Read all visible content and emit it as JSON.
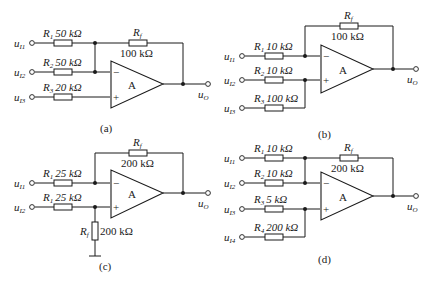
{
  "figure": {
    "circuits": [
      {
        "id": "a",
        "caption": "(a)",
        "amp_label": "A",
        "inputs": [
          {
            "node": "u",
            "sub": "I1",
            "res_name": "R",
            "res_sub": "1",
            "value": "50 kΩ",
            "to": "inverting"
          },
          {
            "node": "u",
            "sub": "I2",
            "res_name": "R",
            "res_sub": "2",
            "value": "50 kΩ",
            "to": "inverting"
          },
          {
            "node": "u",
            "sub": "I3",
            "res_name": "R",
            "res_sub": "3",
            "value": "20 kΩ",
            "to": "non-inverting"
          }
        ],
        "feedback": {
          "res_name": "R",
          "res_sub": "f",
          "value": "100 kΩ"
        },
        "output": {
          "node": "u",
          "sub": "O"
        },
        "minus": "−",
        "plus": "+"
      },
      {
        "id": "b",
        "caption": "(b)",
        "amp_label": "A",
        "inputs": [
          {
            "node": "u",
            "sub": "I1",
            "res_name": "R",
            "res_sub": "1",
            "value": "10 kΩ",
            "to": "inverting"
          },
          {
            "node": "u",
            "sub": "I2",
            "res_name": "R",
            "res_sub": "2",
            "value": "10 kΩ",
            "to": "non-inverting"
          },
          {
            "node": "u",
            "sub": "I3",
            "res_name": "R",
            "res_sub": "3",
            "value": "100 kΩ",
            "to": "non-inverting"
          }
        ],
        "feedback": {
          "res_name": "R",
          "res_sub": "f",
          "value": "100 kΩ"
        },
        "output": {
          "node": "u",
          "sub": "O"
        },
        "minus": "−",
        "plus": "+"
      },
      {
        "id": "c",
        "caption": "(c)",
        "amp_label": "A",
        "inputs": [
          {
            "node": "u",
            "sub": "I1",
            "res_name": "R",
            "res_sub": "1",
            "value": "25 kΩ",
            "to": "inverting"
          },
          {
            "node": "u",
            "sub": "I2",
            "res_name": "R",
            "res_sub": "1",
            "value": "25 kΩ",
            "to": "non-inverting"
          }
        ],
        "feedback": {
          "res_name": "R",
          "res_sub": "f",
          "value": "200 kΩ"
        },
        "ground_resistor": {
          "res_name": "R",
          "res_sub": "f",
          "value": "200 kΩ"
        },
        "output": {
          "node": "u",
          "sub": "O"
        },
        "minus": "−",
        "plus": "+"
      },
      {
        "id": "d",
        "caption": "(d)",
        "amp_label": "A",
        "inputs": [
          {
            "node": "u",
            "sub": "I1",
            "res_name": "R",
            "res_sub": "1",
            "value": "10 kΩ",
            "to": "inverting"
          },
          {
            "node": "u",
            "sub": "I2",
            "res_name": "R",
            "res_sub": "2",
            "value": "10 kΩ",
            "to": "inverting"
          },
          {
            "node": "u",
            "sub": "I3",
            "res_name": "R",
            "res_sub": "3",
            "value": "5 kΩ",
            "to": "non-inverting"
          },
          {
            "node": "u",
            "sub": "I4",
            "res_name": "R",
            "res_sub": "4",
            "value": "200 kΩ",
            "to": "non-inverting"
          }
        ],
        "feedback": {
          "res_name": "R",
          "res_sub": "f",
          "value": "200 kΩ"
        },
        "output": {
          "node": "u",
          "sub": "O"
        },
        "minus": "−",
        "plus": "+"
      }
    ]
  }
}
